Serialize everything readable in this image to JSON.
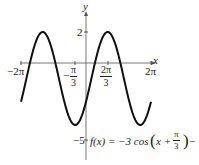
{
  "chart_data": {
    "type": "line",
    "title": "",
    "function_label": "f(x) = −3 cos(x + π/3) − 1",
    "xlabel": "x",
    "ylabel": "y",
    "x_ticks": [
      "−2π",
      "−π/3",
      "2π/3",
      "2π"
    ],
    "x_tick_values": [
      -6.2832,
      -1.0472,
      2.0944,
      6.2832
    ],
    "y_ticks": [
      "2",
      "−5"
    ],
    "y_tick_values": [
      2,
      -5
    ],
    "xlim": [
      -6.2832,
      6.2832
    ],
    "ylim": [
      -5,
      2
    ],
    "grid": false,
    "series": [
      {
        "name": "f(x) = −3cos(x + π/3) − 1",
        "amplitude": 3,
        "phase_shift": -1.0472,
        "vertical_shift": -1,
        "max": 2,
        "min": -4,
        "x": [
          -6.2832,
          -5.236,
          -4.1888,
          -3.1416,
          -2.0944,
          -1.0472,
          0,
          1.0472,
          2.0944,
          3.1416,
          4.1888,
          5.236,
          6.2832
        ],
        "values": [
          -2.5,
          -4,
          -2.5,
          0.5,
          2,
          0.5,
          -2.5,
          -4,
          -2.5,
          0.5,
          2,
          0.5,
          -2.5
        ]
      }
    ]
  },
  "labels": {
    "x_axis": "x",
    "y_axis": "y",
    "tick_neg2pi": "−2π",
    "tick_negpi3_num": "π",
    "tick_negpi3_den": "3",
    "tick_negpi3_sign": "−",
    "tick_2pi3_num": "2π",
    "tick_2pi3_den": "3",
    "tick_2pi": "2π",
    "tick_y2": "2",
    "tick_yneg5": "−5",
    "fn_prefix": "f(x) = −3 cos",
    "fn_x_plus": "x +",
    "fn_pi": "π",
    "fn_3": "3",
    "fn_suffix": "− 1"
  }
}
